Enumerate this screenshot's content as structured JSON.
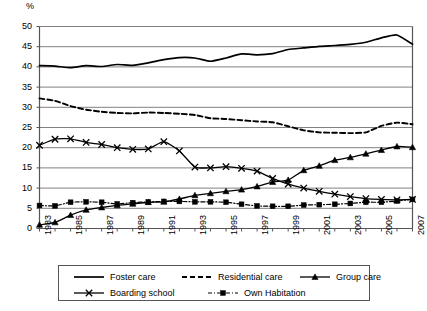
{
  "chart_data": {
    "type": "line",
    "title": "",
    "xlabel": "",
    "ylabel": "%",
    "ylim": [
      0,
      50
    ],
    "ytick_values": [
      0,
      5,
      10,
      15,
      20,
      25,
      30,
      35,
      40,
      45,
      50
    ],
    "grid": true,
    "legend_position": "bottom",
    "x": [
      1983,
      1984,
      1985,
      1986,
      1987,
      1988,
      1989,
      1990,
      1991,
      1992,
      1993,
      1994,
      1995,
      1996,
      1997,
      1998,
      1999,
      2000,
      2001,
      2002,
      2003,
      2004,
      2005,
      2006,
      2007
    ],
    "xtick_labels": [
      "1983",
      "1985",
      "1987",
      "1989",
      "1991",
      "1993",
      "1995",
      "1997",
      "1999",
      "2001",
      "2003",
      "2005",
      "2007"
    ],
    "xtick_years": [
      1983,
      1985,
      1987,
      1989,
      1991,
      1993,
      1995,
      1997,
      1999,
      2001,
      2003,
      2005,
      2007
    ],
    "series": [
      {
        "name": "Foster care",
        "style": "solid",
        "marker": "none",
        "values": [
          40.3,
          40.2,
          39.8,
          40.3,
          40.1,
          40.6,
          40.4,
          41.0,
          41.8,
          42.3,
          42.2,
          41.4,
          42.2,
          43.2,
          43.0,
          43.3,
          44.3,
          44.7,
          45.1,
          45.3,
          45.6,
          46.1,
          47.2,
          47.9,
          45.6
        ]
      },
      {
        "name": "Residential care",
        "style": "dashed",
        "marker": "none",
        "values": [
          32.2,
          31.6,
          30.3,
          29.4,
          28.9,
          28.6,
          28.5,
          28.7,
          28.6,
          28.4,
          28.1,
          27.3,
          27.1,
          26.8,
          26.5,
          26.3,
          25.3,
          24.3,
          23.8,
          23.7,
          23.6,
          23.8,
          25.4,
          26.2,
          25.8
        ]
      },
      {
        "name": "Group care",
        "style": "solid",
        "marker": "triangle",
        "values": [
          0.9,
          1.5,
          3.3,
          4.6,
          5.2,
          5.7,
          6.1,
          6.5,
          6.6,
          7.3,
          8.2,
          8.7,
          9.2,
          9.6,
          10.4,
          11.5,
          12.0,
          14.4,
          15.5,
          16.9,
          17.6,
          18.5,
          19.4,
          20.3,
          20.1
        ]
      },
      {
        "name": "Boarding school",
        "style": "solid",
        "marker": "x",
        "values": [
          20.6,
          22.1,
          22.2,
          21.3,
          20.8,
          20.0,
          19.6,
          19.7,
          21.5,
          19.2,
          15.2,
          15.0,
          15.3,
          14.9,
          14.2,
          12.4,
          11.0,
          10.0,
          9.2,
          8.5,
          7.9,
          7.4,
          7.2,
          7.1,
          7.2
        ]
      },
      {
        "name": "Own Habitation",
        "style": "dashdot",
        "marker": "square",
        "values": [
          5.7,
          5.6,
          6.5,
          6.6,
          6.5,
          6.1,
          6.4,
          6.6,
          6.7,
          6.7,
          6.6,
          6.6,
          6.5,
          6.0,
          5.6,
          5.5,
          5.5,
          5.8,
          5.9,
          6.0,
          6.2,
          6.5,
          6.5,
          6.8,
          7.2
        ]
      }
    ]
  },
  "legend": {
    "items": [
      {
        "label": "Foster care",
        "style": "solid",
        "marker": "none"
      },
      {
        "label": "Residential care",
        "style": "dashed",
        "marker": "none"
      },
      {
        "label": "Group care",
        "style": "solid",
        "marker": "triangle"
      },
      {
        "label": "Boarding school",
        "style": "solid",
        "marker": "x"
      },
      {
        "label": "Own Habitation",
        "style": "dashdot",
        "marker": "square"
      }
    ]
  },
  "colors": {
    "line": "#000000",
    "grid": "#808080",
    "axis": "#555555",
    "background": "#ffffff"
  }
}
